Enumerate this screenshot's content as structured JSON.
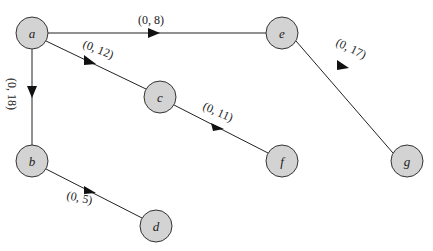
{
  "diagram": {
    "type": "directed-tree",
    "nodes": [
      {
        "id": "a",
        "label": "a",
        "x": 32,
        "y": 33
      },
      {
        "id": "e",
        "label": "e",
        "x": 282,
        "y": 33
      },
      {
        "id": "c",
        "label": "c",
        "x": 160,
        "y": 97
      },
      {
        "id": "g",
        "label": "g",
        "x": 407,
        "y": 161
      },
      {
        "id": "b",
        "label": "b",
        "x": 32,
        "y": 161
      },
      {
        "id": "f",
        "label": "f",
        "x": 282,
        "y": 161
      },
      {
        "id": "d",
        "label": "d",
        "x": 156,
        "y": 226
      }
    ],
    "edges": [
      {
        "from": "a",
        "to": "e",
        "label": "(0, 8)"
      },
      {
        "from": "a",
        "to": "c",
        "label": "(0, 12)"
      },
      {
        "from": "a",
        "to": "b",
        "label": "(0, 18)"
      },
      {
        "from": "e",
        "to": "g",
        "label": "(0, 17)"
      },
      {
        "from": "c",
        "to": "f",
        "label": "(0, 11)"
      },
      {
        "from": "b",
        "to": "d",
        "label": "(0, 5)"
      }
    ]
  },
  "labels": {
    "node_a": "a",
    "node_b": "b",
    "node_c": "c",
    "node_d": "d",
    "node_e": "e",
    "node_f": "f",
    "node_g": "g",
    "edge_ae": "(0, 8)",
    "edge_ac": "(0, 12)",
    "edge_ab": "(0, 18)",
    "edge_eg": "(0, 17)",
    "edge_cf": "(0, 11)",
    "edge_bd": "(0, 5)"
  }
}
